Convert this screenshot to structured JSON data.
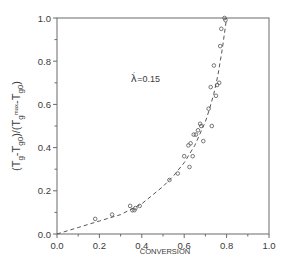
{
  "chart_data": {
    "type": "scatter",
    "title": "",
    "xlabel": "CONVERSION",
    "ylabel": "(T_g-T_g0)/(T_gmax-T_g0)",
    "xlim": [
      0.0,
      1.0
    ],
    "ylim": [
      0.0,
      1.0
    ],
    "x_ticks": [
      "0.0",
      "0.2",
      "0.4",
      "0.6",
      "0.8",
      "1.0"
    ],
    "y_ticks": [
      "0.0",
      "0.2",
      "0.4",
      "0.6",
      "0.8",
      "1.0"
    ],
    "grid": false,
    "legend": null,
    "annotations": [
      {
        "text": "λ' =0.15",
        "x": 0.35,
        "y": 0.73
      }
    ],
    "series": [
      {
        "name": "experimental",
        "style": "open-circle",
        "x": [
          0.18,
          0.26,
          0.345,
          0.355,
          0.365,
          0.37,
          0.39,
          0.53,
          0.57,
          0.6,
          0.62,
          0.625,
          0.63,
          0.64,
          0.645,
          0.655,
          0.665,
          0.675,
          0.68,
          0.69,
          0.715,
          0.725,
          0.73,
          0.74,
          0.75,
          0.755,
          0.765,
          0.77,
          0.775,
          0.79,
          0.795
        ],
        "y": [
          0.07,
          0.09,
          0.13,
          0.11,
          0.11,
          0.12,
          0.13,
          0.25,
          0.28,
          0.36,
          0.41,
          0.31,
          0.42,
          0.36,
          0.46,
          0.46,
          0.48,
          0.51,
          0.5,
          0.43,
          0.58,
          0.68,
          0.5,
          0.78,
          0.64,
          0.69,
          0.7,
          0.87,
          0.95,
          1.0,
          0.99
        ]
      },
      {
        "name": "model fit (λ'=0.15)",
        "style": "dashed-line",
        "x": [
          0.0,
          0.1,
          0.2,
          0.3,
          0.4,
          0.5,
          0.55,
          0.6,
          0.65,
          0.7,
          0.72,
          0.74,
          0.76,
          0.78,
          0.8
        ],
        "y": [
          0.0,
          0.03,
          0.06,
          0.09,
          0.14,
          0.22,
          0.27,
          0.33,
          0.41,
          0.52,
          0.58,
          0.65,
          0.74,
          0.86,
          1.0
        ]
      }
    ]
  }
}
